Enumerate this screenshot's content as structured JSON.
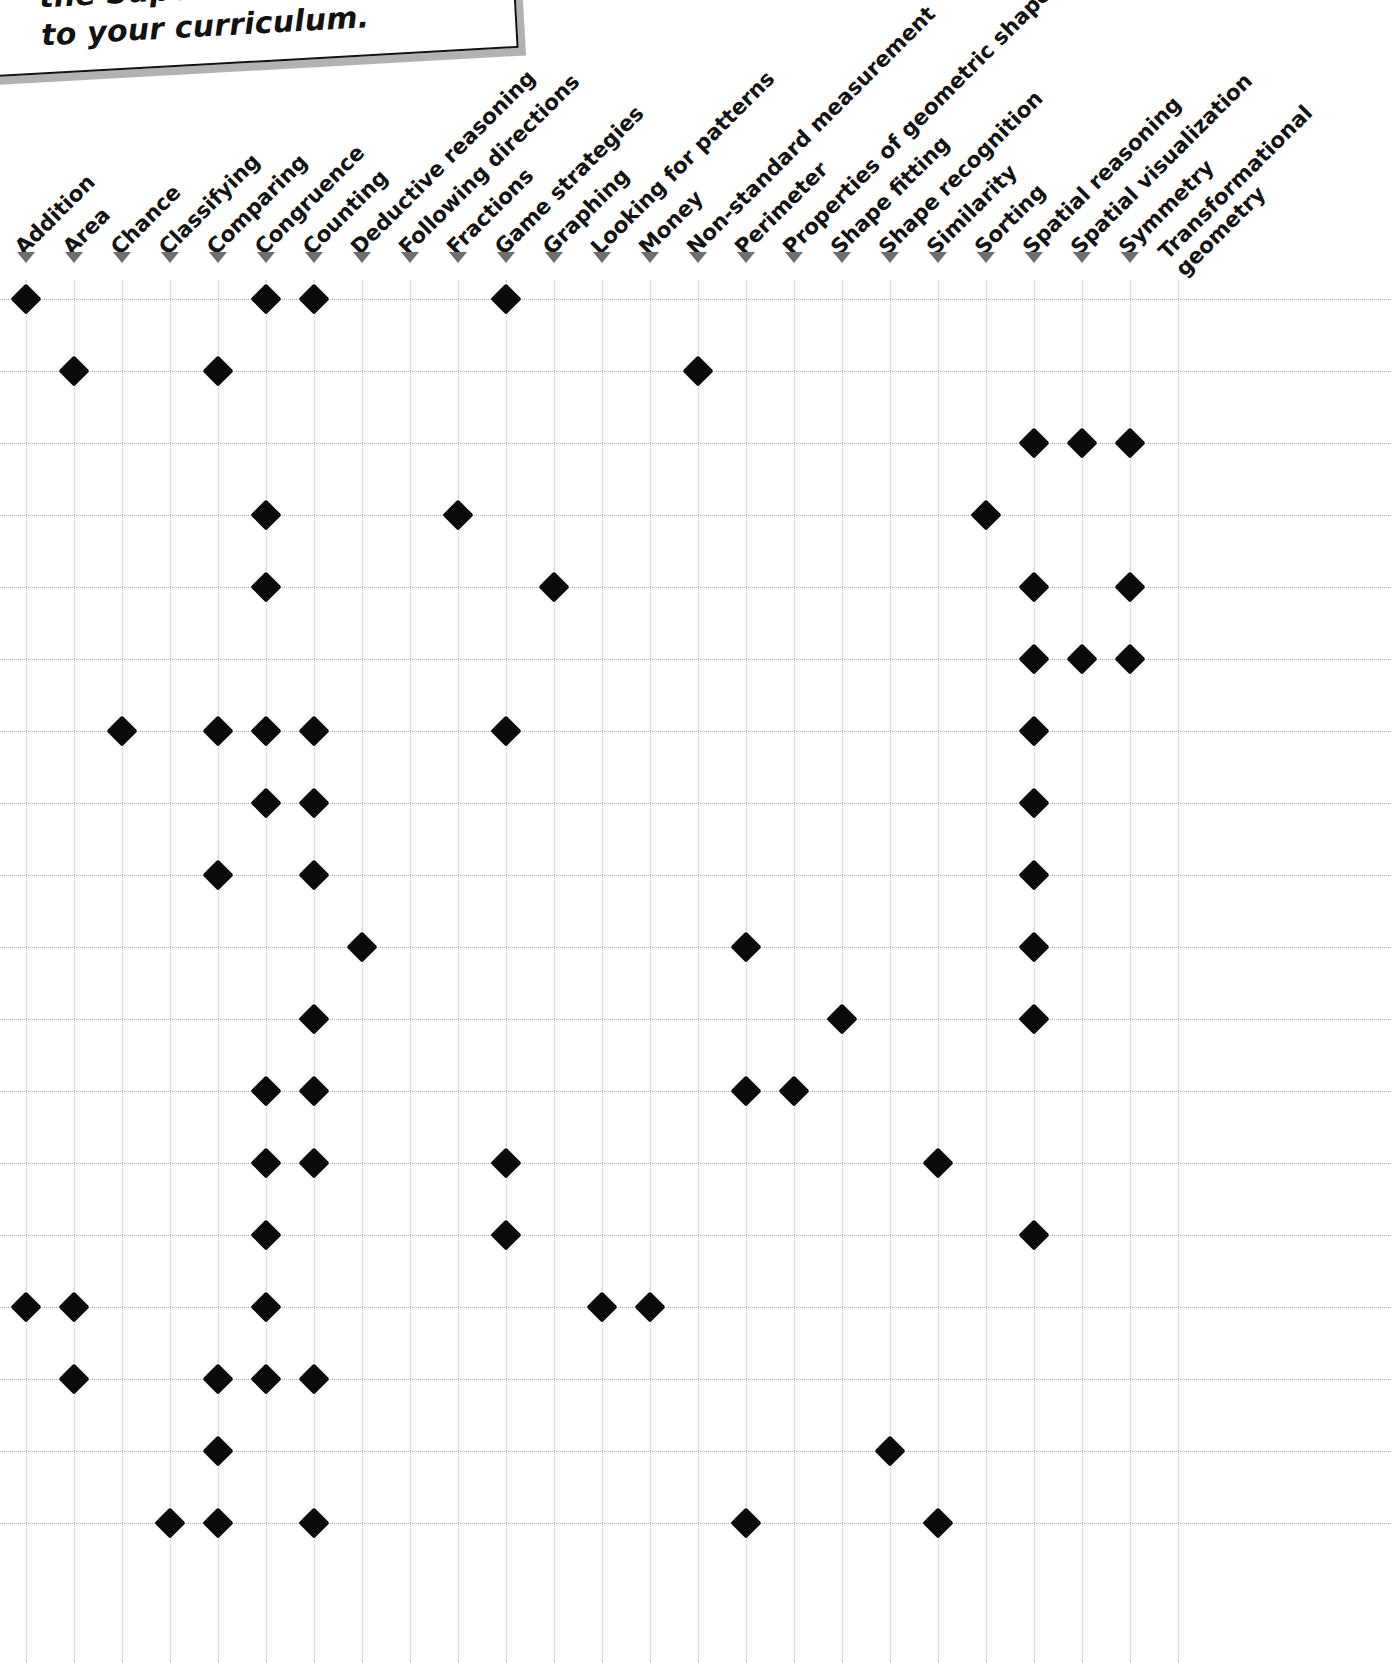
{
  "note": {
    "line1": "the Super Sm…",
    "line2": "to your curriculum.",
    "visible_text": "the Super S... to your curriculum."
  },
  "grid": {
    "mark_icon": "diamond-icon",
    "arrow_icon": "triangle-down-icon",
    "columns": [
      "Addition",
      "Area",
      "Chance",
      "Classifying",
      "Comparing",
      "Congruence",
      "Counting",
      "Deductive reasoning",
      "Following directions",
      "Fractions",
      "Game strategies",
      "Graphing",
      "Looking for patterns",
      "Money",
      "Non-standard measurement",
      "Perimeter",
      "Properties of geometric shapes",
      "Shape fitting",
      "Shape recognition",
      "Similarity",
      "Sorting",
      "Spatial reasoning",
      "Spatial visualization",
      "Symmetry",
      "Transformational geometry"
    ],
    "row_count": 18,
    "geometry": {
      "col_x_start": 26,
      "col_x_step": 48,
      "row_y_start": 19,
      "row_y_step": 72,
      "arrow_y": 252
    },
    "marks": [
      [
        0,
        5,
        6,
        10
      ],
      [
        1,
        4,
        14
      ],
      [
        21,
        22,
        23
      ],
      [
        5,
        9,
        20
      ],
      [
        5,
        11,
        21,
        23
      ],
      [
        21,
        22,
        23
      ],
      [
        2,
        4,
        5,
        6,
        10,
        21
      ],
      [
        5,
        6,
        21
      ],
      [
        4,
        6,
        21
      ],
      [
        7,
        15,
        21
      ],
      [
        6,
        17,
        21
      ],
      [
        5,
        6,
        15,
        16
      ],
      [
        5,
        6,
        10,
        19
      ],
      [
        5,
        10,
        21
      ],
      [
        0,
        1,
        5,
        12,
        13
      ],
      [
        1,
        4,
        5,
        6
      ],
      [
        4,
        18
      ],
      [
        3,
        4,
        6,
        15,
        19
      ]
    ]
  },
  "chart_data": {
    "type": "table",
    "xlabel": "Math skill",
    "ylabel": "Activity",
    "categories": [
      "Addition",
      "Area",
      "Chance",
      "Classifying",
      "Comparing",
      "Congruence",
      "Counting",
      "Deductive reasoning",
      "Following directions",
      "Fractions",
      "Game strategies",
      "Graphing",
      "Looking for patterns",
      "Money",
      "Non-standard measurement",
      "Perimeter",
      "Properties of geometric shapes",
      "Shape fitting",
      "Shape recognition",
      "Similarity",
      "Sorting",
      "Spatial reasoning",
      "Spatial visualization",
      "Symmetry",
      "Transformational geometry"
    ],
    "rows": [
      {
        "row": 1,
        "marked": [
          "Addition",
          "Congruence",
          "Counting",
          "Game strategies"
        ]
      },
      {
        "row": 2,
        "marked": [
          "Area",
          "Comparing",
          "Non-standard measurement"
        ]
      },
      {
        "row": 3,
        "marked": [
          "Spatial reasoning",
          "Spatial visualization",
          "Symmetry"
        ]
      },
      {
        "row": 4,
        "marked": [
          "Congruence",
          "Fractions",
          "Sorting"
        ]
      },
      {
        "row": 5,
        "marked": [
          "Congruence",
          "Graphing",
          "Spatial reasoning",
          "Symmetry"
        ]
      },
      {
        "row": 6,
        "marked": [
          "Spatial reasoning",
          "Spatial visualization",
          "Symmetry"
        ]
      },
      {
        "row": 7,
        "marked": [
          "Chance",
          "Comparing",
          "Congruence",
          "Counting",
          "Game strategies",
          "Spatial reasoning"
        ]
      },
      {
        "row": 8,
        "marked": [
          "Congruence",
          "Counting",
          "Spatial reasoning"
        ]
      },
      {
        "row": 9,
        "marked": [
          "Comparing",
          "Counting",
          "Spatial reasoning"
        ]
      },
      {
        "row": 10,
        "marked": [
          "Deductive reasoning",
          "Perimeter",
          "Spatial reasoning"
        ]
      },
      {
        "row": 11,
        "marked": [
          "Counting",
          "Shape fitting",
          "Spatial reasoning"
        ]
      },
      {
        "row": 12,
        "marked": [
          "Congruence",
          "Counting",
          "Perimeter",
          "Properties of geometric shapes"
        ]
      },
      {
        "row": 13,
        "marked": [
          "Congruence",
          "Counting",
          "Game strategies",
          "Similarity"
        ]
      },
      {
        "row": 14,
        "marked": [
          "Congruence",
          "Game strategies",
          "Spatial reasoning"
        ]
      },
      {
        "row": 15,
        "marked": [
          "Addition",
          "Area",
          "Congruence",
          "Looking for patterns",
          "Money"
        ]
      },
      {
        "row": 16,
        "marked": [
          "Area",
          "Comparing",
          "Congruence",
          "Counting"
        ]
      },
      {
        "row": 17,
        "marked": [
          "Comparing",
          "Shape recognition"
        ]
      },
      {
        "row": 18,
        "marked": [
          "Classifying",
          "Comparing",
          "Counting",
          "Perimeter",
          "Similarity"
        ]
      }
    ],
    "grid": true,
    "legend": "none"
  },
  "colors": {
    "mark": "#0b0b0b",
    "gridline": "#bdbdbd",
    "arrow": "#6f6f6f",
    "text": "#131313",
    "background": "#ffffff"
  }
}
